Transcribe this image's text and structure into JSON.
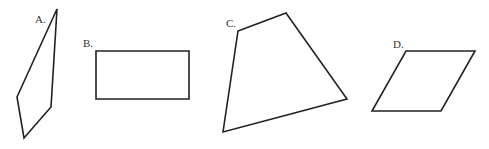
{
  "figure": {
    "background": "#ffffff",
    "stroke_color": "#222222",
    "shapes": [
      {
        "id": "A",
        "label": "A.",
        "type": "quadrilateral",
        "points": "57,9 51,107 24,138 17,97",
        "label_pos": [
          35,
          23
        ]
      },
      {
        "id": "B",
        "label": "B.",
        "type": "rectangle",
        "points": "96,51 189,51 189,99 96,99",
        "label_pos": [
          83,
          47
        ]
      },
      {
        "id": "C",
        "label": "C.",
        "type": "quadrilateral",
        "points": "238,31 286,13 347,99 223,132",
        "label_pos": [
          226,
          27
        ]
      },
      {
        "id": "D",
        "label": "D.",
        "type": "parallelogram",
        "points": "406,51 475,51 441,111 372,111",
        "label_pos": [
          393,
          48
        ]
      }
    ]
  }
}
